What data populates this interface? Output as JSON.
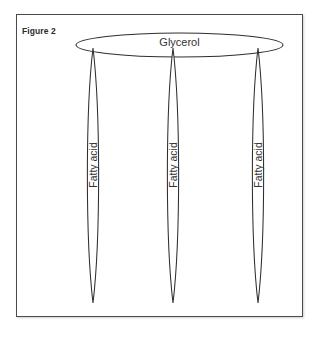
{
  "figure": {
    "caption_label": "Figure 2",
    "background_color": "#ffffff",
    "border_color": "#4a4a4a",
    "stroke_color": "#2e2e2e",
    "text_color": "#333333",
    "frame": {
      "x": 16,
      "y": 14,
      "width": 287,
      "height": 303
    }
  },
  "glycerol": {
    "label": "Glycerol",
    "shape": "ellipse",
    "cx": 179.5,
    "cy": 45,
    "rx": 103.5,
    "ry": 12
  },
  "fatty_acids": [
    {
      "label": "Fatty acid",
      "shape": "lens",
      "cx": 93,
      "top_y": 48,
      "bottom_y": 303,
      "half_width": 7.5
    },
    {
      "label": "Fatty acid",
      "shape": "lens",
      "cx": 173,
      "top_y": 48,
      "bottom_y": 303,
      "half_width": 7.5
    },
    {
      "label": "Fatty acid",
      "shape": "lens",
      "cx": 258,
      "top_y": 48,
      "bottom_y": 303,
      "half_width": 7.5
    }
  ]
}
